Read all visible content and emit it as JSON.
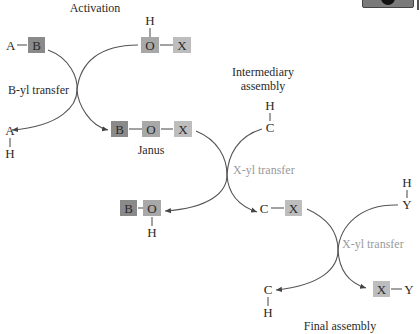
{
  "diagram": {
    "stages": {
      "activation": "Activation",
      "intermediary_line1": "Intermediary",
      "intermediary_line2": "assembly",
      "final": "Final assembly"
    },
    "transfers": {
      "first": "B-yl transfer",
      "second": "X-yl transfer",
      "third": "X-yl transfer"
    },
    "molecules": {
      "reactant_AB": {
        "A": "A",
        "B": "B"
      },
      "reactant_HOX": {
        "H": "H",
        "O": "O",
        "X": "X"
      },
      "product_AH": {
        "A": "A",
        "H": "H"
      },
      "janus": {
        "B": "B",
        "O": "O",
        "X": "X",
        "label": "Janus"
      },
      "reactant_HC": {
        "H": "H",
        "C": "C"
      },
      "product_BOH": {
        "B": "B",
        "O": "O",
        "H": "H"
      },
      "intermediate_CX": {
        "C": "C",
        "X": "X"
      },
      "reactant_HY": {
        "H": "H",
        "Y": "Y"
      },
      "product_CH": {
        "C": "C",
        "H": "H"
      },
      "product_XY": {
        "X": "X",
        "Y": "Y"
      }
    },
    "colors": {
      "box_B": "#8a8a8a",
      "box_O": "#a8a8a8",
      "box_X": "#bdbdbd",
      "transfer_label_gray": "#9a9a9a"
    }
  }
}
